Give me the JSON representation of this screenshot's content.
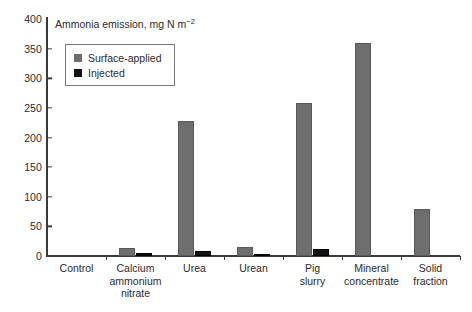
{
  "chart_data": {
    "type": "bar",
    "title": "",
    "axis_note": "Ammonia emission, mg N m",
    "axis_note_sup": "−2",
    "xlabel": "",
    "ylabel": "Ammonia emission, mg N m−2",
    "ylim": [
      0,
      400
    ],
    "ytick_step": 50,
    "yticks": [
      "0",
      "50",
      "100",
      "150",
      "200",
      "250",
      "300",
      "350",
      "400"
    ],
    "ytick_values": [
      0,
      50,
      100,
      150,
      200,
      250,
      300,
      350,
      400
    ],
    "grid": false,
    "legend_position": "upper-left-inside",
    "categories": [
      "Control",
      "Calcium ammonium nitrate",
      "Urea",
      "Urean",
      "Pig slurry",
      "Mineral concentrate",
      "Solid fraction"
    ],
    "category_lines": [
      [
        "Control"
      ],
      [
        "Calcium",
        "ammonium",
        "nitrate"
      ],
      [
        "Urea"
      ],
      [
        "Urean"
      ],
      [
        "Pig",
        "slurry"
      ],
      [
        "Mineral",
        "concentrate"
      ],
      [
        "Solid",
        "fraction"
      ]
    ],
    "series": [
      {
        "name": "Surface-applied",
        "color": "#6e6e6e",
        "values": [
          0,
          13,
          228,
          15,
          258,
          360,
          80
        ]
      },
      {
        "name": "Injected",
        "color": "#121212",
        "values": [
          0,
          5,
          8,
          2,
          12,
          0,
          0
        ]
      }
    ]
  },
  "legend": {
    "items": [
      {
        "label": "Surface-applied",
        "swatch": "surface"
      },
      {
        "label": "Injected",
        "swatch": "injected"
      }
    ]
  }
}
